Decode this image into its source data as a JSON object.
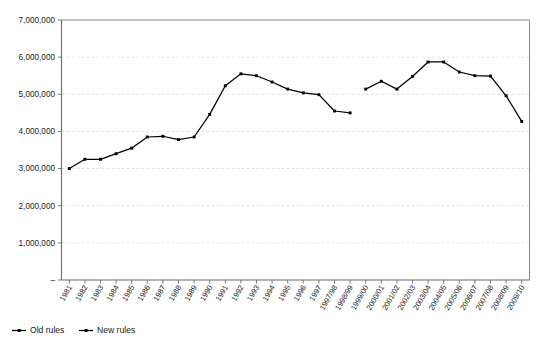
{
  "chart_data": {
    "type": "line",
    "title": "",
    "subtitle": "",
    "xlabel": "",
    "ylabel": "",
    "ylim": [
      0,
      7000000
    ],
    "grid": true,
    "legend_position": "bottom-left",
    "ytick_labels": [
      "7,000,000",
      "6,000,000",
      "5,000,000",
      "4,000,000",
      "3,000,000",
      "2,000,000",
      "1,000,000",
      "–"
    ],
    "ytick_values": [
      7000000,
      6000000,
      5000000,
      4000000,
      3000000,
      2000000,
      1000000,
      0
    ],
    "categories": [
      "1981",
      "1982",
      "1983",
      "1984",
      "1985",
      "1986",
      "1987",
      "1988",
      "1989",
      "1990",
      "1991",
      "1992",
      "1993",
      "1994",
      "1995",
      "1996",
      "1997",
      "1997/98",
      "1998/99",
      "1999/00",
      "2000/01",
      "2001/02",
      "2002/03",
      "2003/04",
      "2004/05",
      "2005/06",
      "2006/07",
      "2007/08",
      "2008/09",
      "2009/10"
    ],
    "series": [
      {
        "name": "Old rules",
        "color": "#000000",
        "values": [
          3000000,
          3250000,
          3250000,
          3400000,
          3550000,
          3850000,
          3870000,
          3780000,
          3850000,
          4460000,
          5230000,
          5550000,
          5500000,
          5330000,
          5140000,
          5040000,
          4990000,
          4550000,
          4500000,
          null,
          null,
          null,
          null,
          null,
          null,
          null,
          null,
          null,
          null,
          null
        ]
      },
      {
        "name": "New rules",
        "color": "#000000",
        "values": [
          null,
          null,
          null,
          null,
          null,
          null,
          null,
          null,
          null,
          null,
          null,
          null,
          null,
          null,
          null,
          null,
          null,
          null,
          null,
          5140000,
          5350000,
          5140000,
          5480000,
          5870000,
          5870000,
          5600000,
          5500000,
          5490000,
          4960000,
          4270000
        ]
      }
    ]
  },
  "legend": {
    "items": [
      {
        "label": "Old rules"
      },
      {
        "label": "New rules"
      }
    ]
  }
}
